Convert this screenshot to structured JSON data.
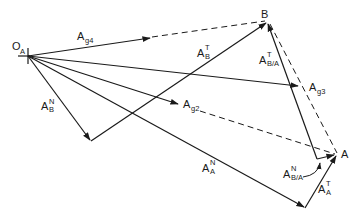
{
  "diagram": {
    "points": {
      "origin": {
        "label": "O",
        "sub": "A",
        "x": 28,
        "y": 56
      },
      "B": {
        "label": "B",
        "x": 267,
        "y": 21
      },
      "A": {
        "label": "A",
        "x": 337,
        "y": 154
      }
    },
    "vectors": [
      {
        "id": "A_g4",
        "label": "A",
        "sub": "g4",
        "sup": ""
      },
      {
        "id": "A_B_T",
        "label": "A",
        "sub": "B",
        "sup": "T"
      },
      {
        "id": "A_B_N",
        "label": "A",
        "sub": "B",
        "sup": "N"
      },
      {
        "id": "A_BA_T",
        "label": "A",
        "sub": "B/A",
        "sup": "T"
      },
      {
        "id": "A_g3",
        "label": "A",
        "sub": "g3",
        "sup": ""
      },
      {
        "id": "A_g2",
        "label": "A",
        "sub": "g2",
        "sup": ""
      },
      {
        "id": "A_A_N",
        "label": "A",
        "sub": "A",
        "sup": "N"
      },
      {
        "id": "A_BA_N",
        "label": "A",
        "sub": "B/A",
        "sup": "N"
      },
      {
        "id": "A_A_T",
        "label": "A",
        "sub": "A",
        "sup": "T"
      }
    ],
    "colors": {
      "ink": "#1a1a1a",
      "background": "#ffffff"
    }
  }
}
